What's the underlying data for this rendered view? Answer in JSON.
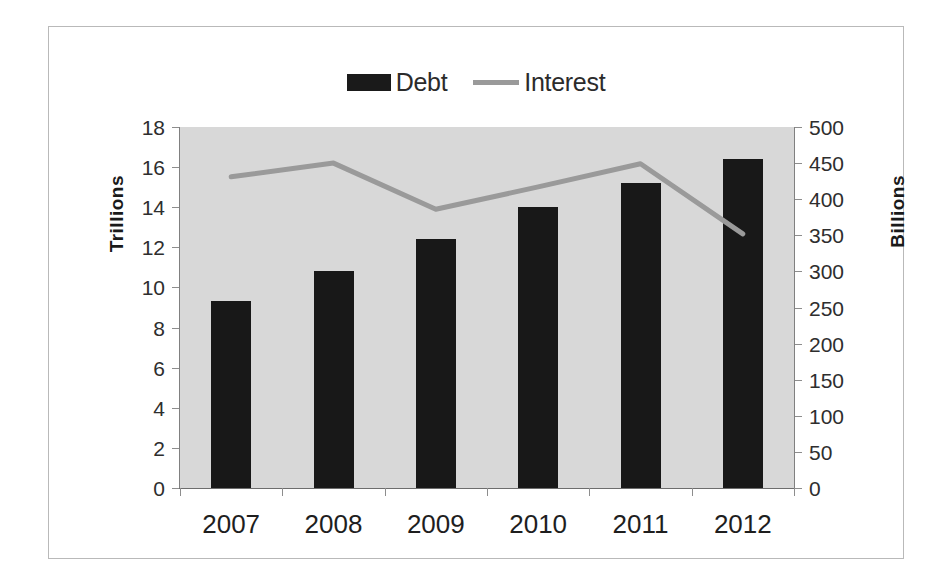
{
  "chart_data": {
    "type": "bar",
    "title": "",
    "subtitle": "",
    "xlabel": "",
    "categories": [
      "2007",
      "2008",
      "2009",
      "2010",
      "2011",
      "2012"
    ],
    "grid": false,
    "legend_position": "top-center",
    "plot_background": "#d8d8d8",
    "series": [
      {
        "name": "Debt",
        "type": "bar",
        "axis": "left",
        "unit": "Trillions",
        "color": "#181818",
        "values": [
          9.3,
          10.8,
          12.4,
          14.0,
          15.2,
          16.4
        ]
      },
      {
        "name": "Interest",
        "type": "line",
        "axis": "right",
        "unit": "Billions",
        "color": "#9a9a9a",
        "values": [
          431,
          450,
          386,
          417,
          449,
          352
        ]
      }
    ],
    "axes": {
      "left": {
        "label": "Trillions",
        "ylim": [
          0,
          18
        ],
        "ticks": [
          18,
          16,
          14,
          12,
          10,
          8,
          6,
          4,
          2,
          0
        ],
        "tick_labels": [
          "18",
          "16",
          "14",
          "12",
          "10",
          "8",
          "6",
          "4",
          "2",
          "0"
        ]
      },
      "right": {
        "label": "Billions",
        "ylim": [
          0,
          500
        ],
        "ticks": [
          500,
          450,
          400,
          350,
          300,
          250,
          200,
          150,
          100,
          50,
          0
        ],
        "tick_labels": [
          "500",
          "450",
          "400",
          "350",
          "300",
          "250",
          "200",
          "150",
          "100",
          "50",
          "0"
        ]
      }
    },
    "legend": [
      {
        "label": "Debt",
        "marker": "bar-swatch",
        "color": "#181818"
      },
      {
        "label": "Interest",
        "marker": "line-swatch",
        "color": "#9a9a9a"
      }
    ]
  }
}
